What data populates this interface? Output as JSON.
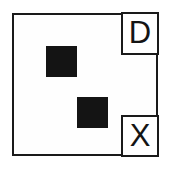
{
  "diagram": {
    "background_color": "#ffffff",
    "frame": {
      "name": "outer-frame",
      "border_color": "#1a1a1a",
      "fill_color": "#fefefe",
      "border_width_px": 2,
      "x": 12,
      "y": 13,
      "width": 146,
      "height": 143
    },
    "filled_squares": [
      {
        "name": "square-upper-left",
        "color": "#141414",
        "x": 44,
        "y": 44,
        "width": 31,
        "height": 31
      },
      {
        "name": "square-lower-right",
        "color": "#141414",
        "x": 75,
        "y": 95,
        "width": 31,
        "height": 31
      }
    ],
    "corner_cells": [
      {
        "name": "cell-top-right",
        "label": "D",
        "position": "top-right",
        "border_color": "#1a1a1a",
        "fill_color": "#ffffff",
        "x": 121,
        "y": 12,
        "width": 38,
        "height": 43
      },
      {
        "name": "cell-bottom-right",
        "label": "X",
        "position": "bottom-right",
        "border_color": "#1a1a1a",
        "fill_color": "#ffffff",
        "x": 121,
        "y": 115,
        "width": 38,
        "height": 42
      }
    ]
  }
}
